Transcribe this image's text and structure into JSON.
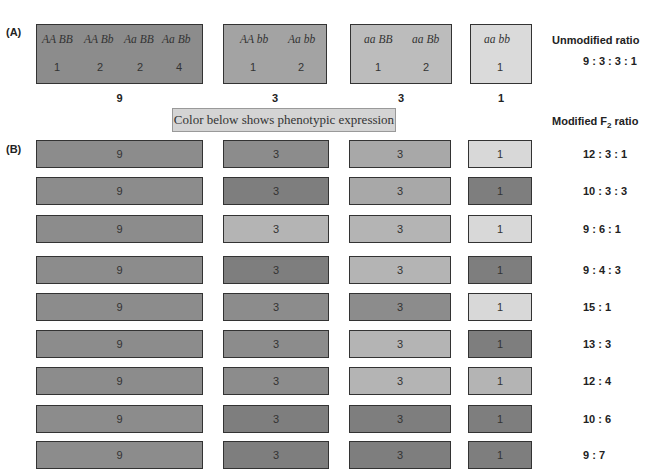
{
  "panel_a": {
    "label": "(A)",
    "groups": [
      {
        "genotypes": [
          "AA BB",
          "AA Bb",
          "Aa BB",
          "Aa Bb"
        ],
        "counts": [
          "1",
          "2",
          "2",
          "4"
        ],
        "total": "9",
        "color": "#8c8c8c"
      },
      {
        "genotypes": [
          "AA bb",
          "Aa bb"
        ],
        "counts": [
          "1",
          "2"
        ],
        "total": "3",
        "color": "#a3a3a3"
      },
      {
        "genotypes": [
          "aa BB",
          "aa Bb"
        ],
        "counts": [
          "1",
          "2"
        ],
        "total": "3",
        "color": "#bcbcbc"
      },
      {
        "genotypes": [
          "aa bb"
        ],
        "counts": [
          "1"
        ],
        "total": "1",
        "color": "#dadada"
      }
    ],
    "heading": "Unmodified ratio",
    "ratio": "9 : 3 : 3 : 1"
  },
  "caption": "Color below shows phenotypic expression",
  "panel_b": {
    "label": "(B)",
    "heading_prefix": "Modified F",
    "heading_sub": "2",
    "heading_suffix": " ratio",
    "rows": [
      {
        "ratio": "12 : 3 : 1",
        "values": [
          "9",
          "3",
          "3",
          "1"
        ],
        "colors": [
          "#8c8c8c",
          "#8c8c8c",
          "#a8a8a8",
          "#d8d8d8"
        ]
      },
      {
        "ratio": "10 : 3 : 3",
        "values": [
          "9",
          "3",
          "3",
          "1"
        ],
        "colors": [
          "#8c8c8c",
          "#7e7e7e",
          "#a8a8a8",
          "#7e7e7e"
        ]
      },
      {
        "ratio": "9 : 6 : 1",
        "values": [
          "9",
          "3",
          "3",
          "1"
        ],
        "colors": [
          "#8c8c8c",
          "#b4b4b4",
          "#b4b4b4",
          "#d8d8d8"
        ]
      },
      {
        "ratio": "9 : 4 : 3",
        "values": [
          "9",
          "3",
          "3",
          "1"
        ],
        "colors": [
          "#8c8c8c",
          "#7e7e7e",
          "#b4b4b4",
          "#7e7e7e"
        ]
      },
      {
        "ratio": "15 : 1",
        "values": [
          "9",
          "3",
          "3",
          "1"
        ],
        "colors": [
          "#8c8c8c",
          "#8c8c8c",
          "#8c8c8c",
          "#d8d8d8"
        ]
      },
      {
        "ratio": "13 : 3",
        "values": [
          "9",
          "3",
          "3",
          "1"
        ],
        "colors": [
          "#8c8c8c",
          "#8c8c8c",
          "#b4b4b4",
          "#7e7e7e"
        ]
      },
      {
        "ratio": "12 : 4",
        "values": [
          "9",
          "3",
          "3",
          "1"
        ],
        "colors": [
          "#8c8c8c",
          "#8c8c8c",
          "#b4b4b4",
          "#b4b4b4"
        ]
      },
      {
        "ratio": "10 : 6",
        "values": [
          "9",
          "3",
          "3",
          "1"
        ],
        "colors": [
          "#8c8c8c",
          "#7e7e7e",
          "#7e7e7e",
          "#7e7e7e"
        ]
      },
      {
        "ratio": "9 : 7",
        "values": [
          "9",
          "3",
          "3",
          "1"
        ],
        "colors": [
          "#8c8c8c",
          "#7e7e7e",
          "#7e7e7e",
          "#7e7e7e"
        ]
      }
    ]
  }
}
